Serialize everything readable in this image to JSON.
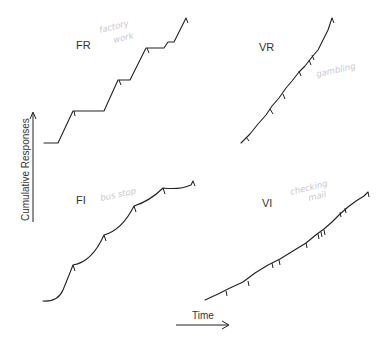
{
  "diagram": {
    "y_axis_label": "Cumulative Responses",
    "x_axis_label": "Time",
    "line_color": "#222222",
    "note_color": "#c8c8d0",
    "panels": [
      {
        "id": "FR",
        "label": "FR",
        "note": "factory work",
        "note_lines": [
          "factory",
          "work"
        ],
        "shape": "stair-step with pauses after reinforcement"
      },
      {
        "id": "VR",
        "label": "VR",
        "note": "gambling",
        "note_lines": [
          "gambling"
        ],
        "shape": "steep steady line"
      },
      {
        "id": "FI",
        "label": "FI",
        "note": "bus stop",
        "note_lines": [
          "bus stop"
        ],
        "shape": "scalloped curve"
      },
      {
        "id": "VI",
        "label": "VI",
        "note": "checking mail",
        "note_lines": [
          "checking",
          "mail"
        ],
        "shape": "moderate steady line"
      }
    ]
  }
}
